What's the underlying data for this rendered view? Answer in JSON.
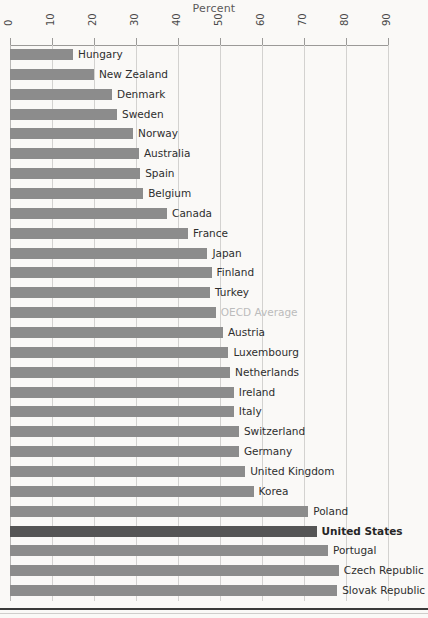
{
  "chart_data": {
    "type": "bar",
    "orientation": "horizontal",
    "title": "Percent",
    "xlabel": "Percent",
    "ylabel": "",
    "xlim": [
      0,
      90
    ],
    "xticks": [
      0,
      10,
      20,
      30,
      40,
      50,
      60,
      70,
      80,
      90
    ],
    "tick_labels": [
      "0",
      "10",
      "20",
      "30",
      "40",
      "50",
      "60",
      "70",
      "80",
      "90"
    ],
    "grid": true,
    "legend": false,
    "categories": [
      "Hungary",
      "New Zealand",
      "Denmark",
      "Sweden",
      "Norway",
      "Australia",
      "Spain",
      "Belgium",
      "Canada",
      "France",
      "Japan",
      "Finland",
      "Turkey",
      "OECD Average",
      "Austria",
      "Luxembourg",
      "Netherlands",
      "Ireland",
      "Italy",
      "Switzerland",
      "Germany",
      "United Kingdom",
      "Korea",
      "Poland",
      "United States",
      "Portugal",
      "Czech Republic",
      "Slovak Republic"
    ],
    "values": [
      15.0,
      20.0,
      24.3,
      25.5,
      29.3,
      30.7,
      31.0,
      31.7,
      37.4,
      42.4,
      47.0,
      48.0,
      47.6,
      49.0,
      50.7,
      52.0,
      52.4,
      53.3,
      53.3,
      54.5,
      54.5,
      56.0,
      58.0,
      71.0,
      73.0,
      75.7,
      78.3,
      77.9
    ],
    "highlight_category": "United States",
    "muted_category": "OECD Average",
    "colors": {
      "bar": "#8c8c8c",
      "bar_highlight": "#555555",
      "grid": "#d3d2d0",
      "axis": "#9b9a98",
      "label": "#2e2e2e",
      "label_muted": "#bcbcbc",
      "background": "#faf9f7"
    }
  }
}
